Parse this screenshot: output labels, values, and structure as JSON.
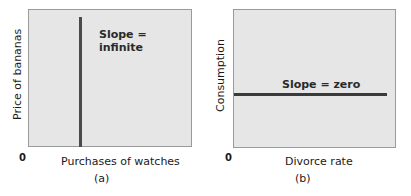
{
  "chart_data": [
    {
      "type": "line",
      "panel": "(a)",
      "xlabel": "Purchases of watches",
      "ylabel": "Price of bananas",
      "origin_label": "0",
      "annotation": "Slope = infinite",
      "annotation_lines": [
        "Slope =",
        "infinite"
      ],
      "series": [
        {
          "name": "vertical line",
          "x": [
            0.3,
            0.3
          ],
          "y": [
            0,
            1
          ]
        }
      ],
      "grid": false,
      "colors": {
        "background": "#e6e6e6",
        "line": "#4a4a4a",
        "border": "#9a9a9a"
      }
    },
    {
      "type": "line",
      "panel": "(b)",
      "xlabel": "Divorce rate",
      "ylabel": "Consumption",
      "origin_label": "0",
      "annotation": "Slope = zero",
      "series": [
        {
          "name": "horizontal line",
          "x": [
            0,
            0.95
          ],
          "y": [
            0.4,
            0.4
          ]
        }
      ],
      "grid": false,
      "colors": {
        "background": "#e6e6e6",
        "line": "#3a3a3a",
        "border": "#9a9a9a"
      }
    }
  ]
}
